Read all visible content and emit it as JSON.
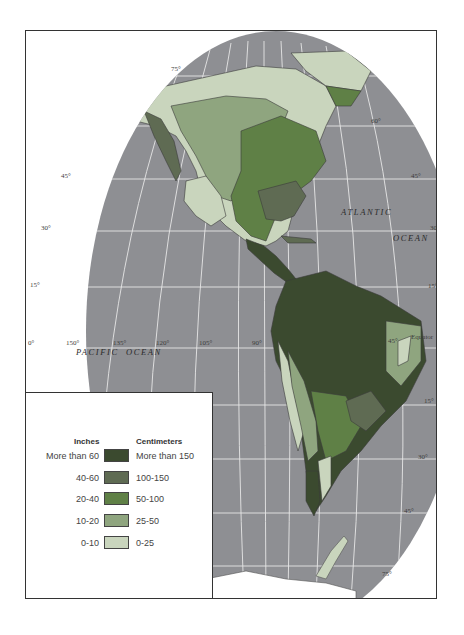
{
  "colors": {
    "ocean": "#8e8f93",
    "grid": "#e6e6e6",
    "background": "#ffffff",
    "antarctica": "#ffffff"
  },
  "legend": {
    "inches_header": "Inches",
    "centimeters_header": "Centimeters",
    "classes": [
      {
        "inches": "More than 60",
        "centimeters": "More than 150",
        "color": "#3b4a2f"
      },
      {
        "inches": "40-60",
        "centimeters": "100-150",
        "color": "#5f6b53"
      },
      {
        "inches": "20-40",
        "centimeters": "50-100",
        "color": "#5f8046"
      },
      {
        "inches": "10-20",
        "centimeters": "25-50",
        "color": "#8fa57f"
      },
      {
        "inches": "0-10",
        "centimeters": "0-25",
        "color": "#c9d5bd"
      }
    ]
  },
  "ocean_labels": {
    "atlantic_1": "ATLANTIC",
    "atlantic_2": "OCEAN",
    "pacific_1": "PACIFIC",
    "pacific_2": "OCEAN"
  },
  "graticule_labels": {
    "lat_75": "75°",
    "lat_60": "60°",
    "lat_45_w": "45°",
    "lat_45_e": "45°",
    "lat_30_w": "30°",
    "lat_30_e": "30°",
    "lat_15_w": "15°",
    "lat_15_e": "15°",
    "lat_0": "0°",
    "equator": "Equator",
    "lat_s15_w": "15°",
    "lat_s15_e": "15°",
    "lat_s30": "30°",
    "lat_s45": "45°",
    "lon_150": "150°",
    "lon_135": "135°",
    "lon_120": "120°",
    "lon_105": "105°",
    "lon_90": "90°",
    "lon_45": "45°",
    "lon_75": "75°"
  }
}
